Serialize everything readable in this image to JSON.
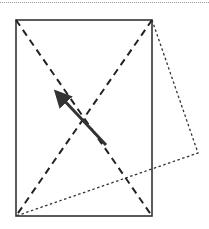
{
  "diagram": {
    "type": "geometry",
    "colors": {
      "stroke": "#333333",
      "background": "#ffffff",
      "rule": "#9a9a9a"
    },
    "rectangle": {
      "x": 16,
      "y": 20,
      "width": 136,
      "height": 196
    },
    "diagonals": [
      {
        "x1": 16,
        "y1": 20,
        "x2": 152,
        "y2": 216
      },
      {
        "x1": 152,
        "y1": 20,
        "x2": 16,
        "y2": 216
      }
    ],
    "folded_triangle": {
      "points": [
        [
          152,
          20
        ],
        [
          198,
          153
        ],
        [
          16,
          216
        ]
      ]
    },
    "arrow": {
      "from": [
        106,
        145
      ],
      "to": [
        60,
        96
      ]
    }
  }
}
